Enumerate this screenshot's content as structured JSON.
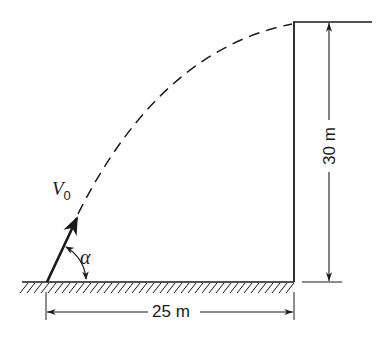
{
  "diagram": {
    "type": "projectile-motion",
    "colors": {
      "ink": "#1a1a1a",
      "background": "#ffffff"
    },
    "labels": {
      "velocity_symbol": "V",
      "velocity_subscript": "0",
      "angle_symbol": "α",
      "horizontal_distance": "25 m",
      "cliff_height": "30 m"
    },
    "elements": [
      "ground-with-hatching",
      "vertical-cliff-wall",
      "cliff-top-surface",
      "initial-velocity-arrow",
      "launch-angle-arc",
      "dashed-parabolic-trajectory",
      "horizontal-dimension-25m",
      "vertical-dimension-30m"
    ]
  }
}
